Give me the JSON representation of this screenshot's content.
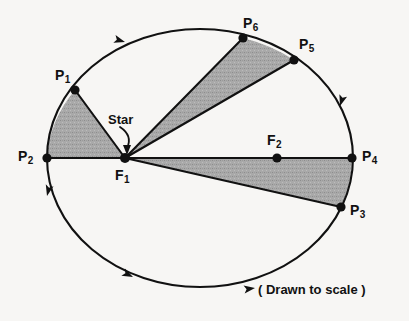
{
  "figure": {
    "caption": "( Drawn to scale )",
    "background_color": "#f7f6f4",
    "stroke_color": "#111111",
    "sector_fill_color": "#a8a8a8",
    "point_marker_color": "#111111"
  },
  "annotations": {
    "star_label": "Star",
    "star_points_to": "F1"
  },
  "points": [
    {
      "id": "P1",
      "base": "P",
      "sub": "1",
      "x": 75,
      "y": 90,
      "label_x": 55,
      "label_y": 68,
      "is_focus": false
    },
    {
      "id": "P2",
      "base": "P",
      "sub": "2",
      "x": 47,
      "y": 158,
      "label_x": 18,
      "label_y": 149,
      "is_focus": false
    },
    {
      "id": "P3",
      "base": "P",
      "sub": "3",
      "x": 341,
      "y": 207,
      "label_x": 350,
      "label_y": 203,
      "is_focus": false
    },
    {
      "id": "P4",
      "base": "P",
      "sub": "4",
      "x": 352,
      "y": 158,
      "label_x": 362,
      "label_y": 149,
      "is_focus": false
    },
    {
      "id": "P5",
      "base": "P",
      "sub": "5",
      "x": 294,
      "y": 60,
      "label_x": 299,
      "label_y": 37,
      "is_focus": false
    },
    {
      "id": "P6",
      "base": "P",
      "sub": "6",
      "x": 243,
      "y": 38,
      "label_x": 243,
      "label_y": 16,
      "is_focus": false
    },
    {
      "id": "F1",
      "base": "F",
      "sub": "1",
      "x": 125,
      "y": 158,
      "label_x": 115,
      "label_y": 168,
      "is_focus": true
    },
    {
      "id": "F2",
      "base": "F",
      "sub": "2",
      "x": 277,
      "y": 158,
      "label_x": 267,
      "label_y": 133,
      "is_focus": true
    }
  ],
  "ellipse": {
    "center_x": 200,
    "center_y": 158,
    "semi_major_a": 153,
    "semi_minor_b": 129
  },
  "sectors": [
    {
      "name": "sector-P1-P2",
      "from": "P1",
      "to": "P2",
      "apex": "F1",
      "fill": "#a8a8a8"
    },
    {
      "name": "sector-P5-P6",
      "from": "P6",
      "to": "P5",
      "apex": "F1",
      "fill": "#a8a8a8"
    },
    {
      "name": "sector-P3-P4",
      "from": "P4",
      "to": "P3",
      "apex": "F1",
      "fill": "#a8a8a8"
    }
  ],
  "radius_lines": [
    {
      "name": "radius-F1-P1",
      "from": "F1",
      "to": "P1"
    },
    {
      "name": "radius-F1-P2",
      "from": "F1",
      "to": "P2"
    },
    {
      "name": "radius-F1-P3",
      "from": "F1",
      "to": "P3"
    },
    {
      "name": "radius-F1-P4",
      "from": "F1",
      "to": "P4"
    },
    {
      "name": "radius-F1-P5",
      "from": "F1",
      "to": "P5"
    },
    {
      "name": "radius-F1-P6",
      "from": "F1",
      "to": "P6"
    }
  ],
  "direction_arrows": [
    {
      "name": "orbit-direction-arrow-top-left",
      "x": 125,
      "y": 42,
      "angle": 196
    },
    {
      "name": "orbit-direction-arrow-left",
      "x": 47,
      "y": 196,
      "angle": 284
    },
    {
      "name": "orbit-direction-arrow-bottom-left",
      "x": 133,
      "y": 277,
      "angle": 26
    },
    {
      "name": "orbit-direction-arrow-bottom-right",
      "x": 255,
      "y": 288,
      "angle": 352
    },
    {
      "name": "orbit-direction-arrow-right",
      "x": 340,
      "y": 106,
      "angle": 287
    }
  ]
}
